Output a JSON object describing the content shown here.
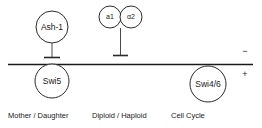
{
  "diagram": {
    "type": "regulatory-network-axis",
    "axis": {
      "orientation": "horizontal",
      "negative_sign": "−",
      "positive_sign": "+"
    },
    "nodes": [
      {
        "id": "ash1",
        "label": "Ash-1",
        "size": "big",
        "position": "above-axis",
        "cx": 52,
        "cy": 27
      },
      {
        "id": "a1",
        "label": "a1",
        "size": "small",
        "position": "above-axis",
        "cx": 110,
        "cy": 17
      },
      {
        "id": "alpha2",
        "label": "α2",
        "size": "small",
        "position": "above-axis",
        "cx": 131,
        "cy": 17
      },
      {
        "id": "swi5",
        "label": "Swi5",
        "size": "big",
        "position": "on-axis",
        "cx": 52,
        "cy": 81
      },
      {
        "id": "swi46",
        "label": "Swi4/6",
        "size": "big",
        "position": "on-axis",
        "cx": 208,
        "cy": 84
      }
    ],
    "edges": [
      {
        "id": "ash1-inhibits-swi5",
        "from": "ash1",
        "to": "swi5",
        "kind": "inhibition"
      },
      {
        "id": "a1-alpha2-inhibits",
        "from": "alpha2",
        "to": "axis",
        "kind": "inhibition"
      }
    ],
    "captions": [
      {
        "id": "mother-daughter",
        "text": "Mother / Daughter"
      },
      {
        "id": "diploid-haploid",
        "text": "Diploid / Haploid"
      },
      {
        "id": "cell-cycle",
        "text": "Cell Cycle"
      }
    ],
    "colors": {
      "stroke": "#2b2b2b",
      "axis": "#1a1a1a",
      "connector": "#4a4a4a",
      "background": "#ffffff",
      "text": "#1a1a1a"
    }
  }
}
